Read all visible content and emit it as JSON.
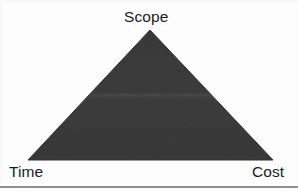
{
  "diagram": {
    "name": "project-management-triangle",
    "background_color": "#fdfdfd",
    "shape": {
      "type": "triangle",
      "fill_color": "#3a3a3a",
      "apex": {
        "x": 150,
        "y": 30
      },
      "bottom_left": {
        "x": 28,
        "y": 160
      },
      "bottom_right": {
        "x": 273,
        "y": 160
      },
      "interior_band_y": 105,
      "interior_band_color": "#474747"
    },
    "vertices": [
      {
        "id": "scope",
        "label": "Scope",
        "position": "apex-top"
      },
      {
        "id": "time",
        "label": "Time",
        "position": "bottom-left"
      },
      {
        "id": "cost",
        "label": "Cost",
        "position": "bottom-right"
      }
    ],
    "labels": {
      "scope": "Scope",
      "time": "Time",
      "cost": "Cost"
    },
    "rule": {
      "color": "#8d8e90"
    }
  }
}
